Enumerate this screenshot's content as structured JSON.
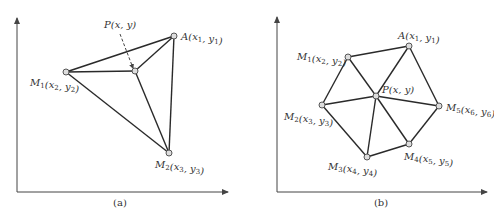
{
  "figures": [
    {
      "id": "a",
      "caption": "(a)",
      "caption_pos": [
        120,
        206
      ],
      "axes": {
        "origin": [
          17,
          192
        ],
        "y_top": 18,
        "x_right": 228
      },
      "points": [
        {
          "name": "A",
          "coord_label": "(x1, y1)",
          "base": "A",
          "args": [
            [
              "x",
              "1"
            ],
            [
              "y",
              "1"
            ]
          ],
          "x": 174,
          "y": 36,
          "label_x": 181,
          "label_y": 40
        },
        {
          "name": "M1",
          "base": "M",
          "base_sub": "1",
          "args": [
            [
              "x",
              "2"
            ],
            [
              "y",
              "2"
            ]
          ],
          "x": 66,
          "y": 72,
          "label_x": 30,
          "label_y": 86
        },
        {
          "name": "M2",
          "base": "M",
          "base_sub": "2",
          "args": [
            [
              "x",
              "3"
            ],
            [
              "y",
              "3"
            ]
          ],
          "x": 169,
          "y": 153,
          "label_x": 155,
          "label_y": 168
        },
        {
          "name": "P",
          "base": "P",
          "args": [
            [
              "x",
              ""
            ],
            [
              "y",
              ""
            ]
          ],
          "x": 135,
          "y": 71,
          "label_x": 104,
          "label_y": 28
        }
      ],
      "edges": [
        [
          "A",
          "M1"
        ],
        [
          "M1",
          "M2"
        ],
        [
          "M2",
          "A"
        ],
        [
          "P",
          "A"
        ],
        [
          "P",
          "M1"
        ],
        [
          "P",
          "M2"
        ]
      ],
      "pointer": {
        "from": [
          120,
          34
        ],
        "to": [
          133,
          68
        ],
        "style": "dashed-arrow"
      }
    },
    {
      "id": "b",
      "caption": "(b)",
      "caption_pos": [
        381,
        206
      ],
      "axes": {
        "origin": [
          277,
          192
        ],
        "y_top": 17,
        "x_right": 487
      },
      "points": [
        {
          "name": "A",
          "base": "A",
          "args": [
            [
              "x",
              "1"
            ],
            [
              "y",
              "1"
            ]
          ],
          "x": 409,
          "y": 46,
          "label_x": 398,
          "label_y": 39
        },
        {
          "name": "M1",
          "base": "M",
          "base_sub": "1",
          "args": [
            [
              "x",
              "2"
            ],
            [
              "y",
              "2"
            ]
          ],
          "x": 348,
          "y": 57,
          "label_x": 297,
          "label_y": 60
        },
        {
          "name": "M2",
          "base": "M",
          "base_sub": "2",
          "args": [
            [
              "x",
              "3"
            ],
            [
              "y",
              "3"
            ]
          ],
          "x": 322,
          "y": 105,
          "label_x": 284,
          "label_y": 120
        },
        {
          "name": "M3",
          "base": "M",
          "base_sub": "3",
          "args": [
            [
              "x",
              "4"
            ],
            [
              "y",
              "4"
            ]
          ],
          "x": 367,
          "y": 157,
          "label_x": 328,
          "label_y": 170
        },
        {
          "name": "M4",
          "base": "M",
          "base_sub": "4",
          "args": [
            [
              "x",
              "5"
            ],
            [
              "y",
              "5"
            ]
          ],
          "x": 409,
          "y": 144,
          "label_x": 404,
          "label_y": 160
        },
        {
          "name": "M5",
          "base": "M",
          "base_sub": "5",
          "args": [
            [
              "x",
              "6"
            ],
            [
              "y",
              "6"
            ]
          ],
          "x": 439,
          "y": 106,
          "label_x": 446,
          "label_y": 111
        },
        {
          "name": "P",
          "base": "P",
          "args": [
            [
              "x",
              ""
            ],
            [
              "y",
              ""
            ]
          ],
          "x": 376,
          "y": 96,
          "label_x": 382,
          "label_y": 93
        }
      ],
      "edges": [
        [
          "A",
          "M1"
        ],
        [
          "M1",
          "M2"
        ],
        [
          "M2",
          "M3"
        ],
        [
          "M3",
          "M4"
        ],
        [
          "M4",
          "M5"
        ],
        [
          "M5",
          "A"
        ],
        [
          "P",
          "A"
        ],
        [
          "P",
          "M1"
        ],
        [
          "P",
          "M2"
        ],
        [
          "P",
          "M3"
        ],
        [
          "P",
          "M4"
        ],
        [
          "P",
          "M5"
        ]
      ]
    }
  ]
}
